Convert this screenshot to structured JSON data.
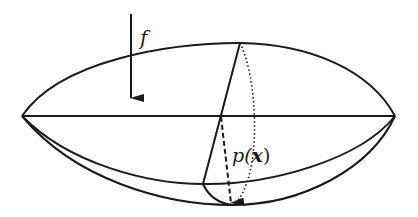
{
  "diagram": {
    "labels": {
      "force": "f",
      "displacement_func": "p(",
      "displacement_var": "x",
      "displacement_close": ")"
    },
    "colors": {
      "stroke": "#1a1a1a",
      "background": "#ffffff"
    }
  }
}
